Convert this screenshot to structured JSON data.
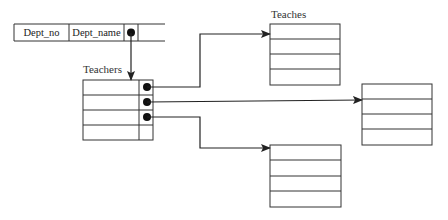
{
  "diagram": {
    "colors": {
      "line": "#333333",
      "background": "#ffffff"
    },
    "dept_record": {
      "fields": [
        "Dept_no",
        "Dept_name"
      ],
      "pointer_field": "pointer-to-teachers"
    },
    "teachers_table": {
      "label": "Teachers",
      "rows": 4,
      "pointer_rows": 3
    },
    "teaches_table": {
      "label": "Teaches",
      "rows": 4
    },
    "right_table": {
      "label": "",
      "rows": 4
    },
    "bottom_table": {
      "label": "",
      "rows": 4
    },
    "connections": [
      {
        "from": "dept_record.pointer",
        "to": "teachers_table"
      },
      {
        "from": "teachers_table.row1.pointer",
        "to": "teaches_table"
      },
      {
        "from": "teachers_table.row2.pointer",
        "to": "right_table"
      },
      {
        "from": "teachers_table.row3.pointer",
        "to": "bottom_table"
      }
    ]
  }
}
